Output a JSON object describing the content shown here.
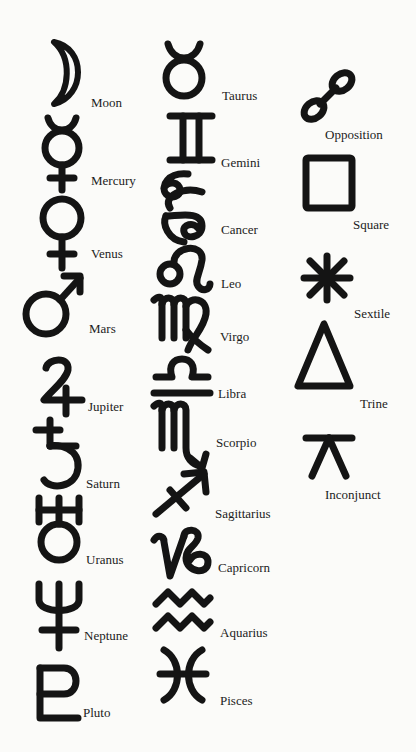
{
  "page": {
    "background": "#fbfbf9",
    "ink": "#141414"
  },
  "planets": {
    "heading": "",
    "items": [
      {
        "name": "moon",
        "label": "Moon"
      },
      {
        "name": "mercury",
        "label": "Mercury"
      },
      {
        "name": "venus",
        "label": "Venus"
      },
      {
        "name": "mars",
        "label": "Mars"
      },
      {
        "name": "jupiter",
        "label": "Jupiter"
      },
      {
        "name": "saturn",
        "label": "Saturn"
      },
      {
        "name": "uranus",
        "label": "Uranus"
      },
      {
        "name": "neptune",
        "label": "Neptune"
      },
      {
        "name": "pluto",
        "label": "Pluto"
      }
    ]
  },
  "signs": {
    "items": [
      {
        "name": "taurus",
        "label": "Taurus"
      },
      {
        "name": "gemini",
        "label": "Gemini"
      },
      {
        "name": "cancer",
        "label": "Cancer"
      },
      {
        "name": "leo",
        "label": "Leo"
      },
      {
        "name": "virgo",
        "label": "Virgo"
      },
      {
        "name": "libra",
        "label": "Libra"
      },
      {
        "name": "scorpio",
        "label": "Scorpio"
      },
      {
        "name": "sagittarius",
        "label": "Sagittarius"
      },
      {
        "name": "capricorn",
        "label": "Capricorn"
      },
      {
        "name": "aquarius",
        "label": "Aquarius"
      },
      {
        "name": "pisces",
        "label": "Pisces"
      }
    ]
  },
  "aspects": {
    "items": [
      {
        "name": "opposition",
        "label": "Opposition"
      },
      {
        "name": "square",
        "label": "Square"
      },
      {
        "name": "sextile",
        "label": "Sextile"
      },
      {
        "name": "trine",
        "label": "Trine"
      },
      {
        "name": "inconjunct",
        "label": "Inconjunct"
      }
    ]
  }
}
